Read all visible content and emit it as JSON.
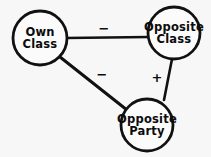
{
  "figure": {
    "background_color": "#f7f7f7",
    "ink_color": "#111111",
    "node_fill_color": "#fbfbfb"
  },
  "nodes": [
    {
      "id": "own-class",
      "line1": "Own",
      "line2": "Class",
      "cx": 40,
      "cy": 38,
      "r": 27,
      "font_size": 11.5,
      "line_gap": 12
    },
    {
      "id": "opposite-class",
      "line1": "Opposite",
      "line2": "Class",
      "cx": 174,
      "cy": 33,
      "r": 26,
      "font_size": 11.5,
      "line_gap": 12
    },
    {
      "id": "opposite-party",
      "line1": "Opposite",
      "line2": "Party",
      "cx": 147,
      "cy": 125,
      "r": 26,
      "font_size": 11.5,
      "line_gap": 12
    }
  ],
  "edges": [
    {
      "id": "own-class--opposite-class",
      "from": "own-class",
      "to": "opposite-class",
      "sign": "−",
      "x1": 66,
      "y1": 38,
      "x2": 149,
      "y2": 37,
      "stroke_width": 2.6,
      "label_x": 104,
      "label_y": 29,
      "label_font_size": 13
    },
    {
      "id": "own-class--opposite-party",
      "from": "own-class",
      "to": "opposite-party",
      "sign": "−",
      "x1": 60,
      "y1": 57,
      "x2": 127,
      "y2": 110,
      "stroke_width": 3.0,
      "label_x": 102,
      "label_y": 75,
      "label_font_size": 13
    },
    {
      "id": "opposite-class--opposite-party",
      "from": "opposite-class",
      "to": "opposite-party",
      "sign": "+",
      "x1": 172,
      "y1": 59,
      "x2": 164,
      "y2": 100,
      "stroke_width": 2.6,
      "label_x": 157,
      "label_y": 78,
      "label_font_size": 13
    }
  ]
}
